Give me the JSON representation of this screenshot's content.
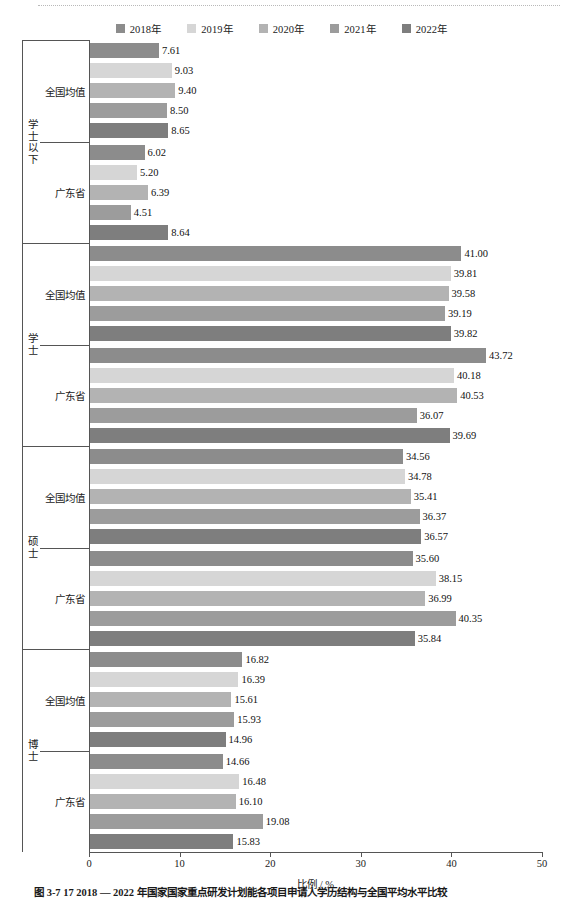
{
  "chart_data": {
    "type": "bar",
    "orientation": "horizontal",
    "title": "",
    "xlabel": "比例 / %",
    "ylabel": "",
    "xlim": [
      0,
      50
    ],
    "xticks": [
      0,
      10,
      20,
      30,
      40,
      50
    ],
    "grid": false,
    "legend_position": "top-center",
    "legend": [
      "2018年",
      "2019年",
      "2020年",
      "2021年",
      "2022年"
    ],
    "series_colors": [
      "#8c8c8c",
      "#d6d6d6",
      "#b3b3b3",
      "#9c9c9c",
      "#7e7e7e"
    ],
    "groups": [
      {
        "label": "学士以下",
        "subgroups": [
          {
            "label": "全国均值",
            "values": [
              7.61,
              9.03,
              9.4,
              8.5,
              8.65
            ],
            "value_labels": [
              "7.61",
              "9.03",
              "9.40",
              "8.50",
              "8.65"
            ]
          },
          {
            "label": "广东省",
            "values": [
              6.02,
              5.2,
              6.39,
              4.51,
              8.64
            ],
            "value_labels": [
              "6.02",
              "5.20",
              "6.39",
              "4.51",
              "8.64"
            ]
          }
        ]
      },
      {
        "label": "学士",
        "subgroups": [
          {
            "label": "全国均值",
            "values": [
              41.0,
              39.81,
              39.58,
              39.19,
              39.82
            ],
            "value_labels": [
              "41.00",
              "39.81",
              "39.58",
              "39.19",
              "39.82"
            ]
          },
          {
            "label": "广东省",
            "values": [
              43.72,
              40.18,
              40.53,
              36.07,
              39.69
            ],
            "value_labels": [
              "43.72",
              "40.18",
              "40.53",
              "36.07",
              "39.69"
            ]
          }
        ]
      },
      {
        "label": "硕士",
        "subgroups": [
          {
            "label": "全国均值",
            "values": [
              34.56,
              34.78,
              35.41,
              36.37,
              36.57
            ],
            "value_labels": [
              "34.56",
              "34.78",
              "35.41",
              "36.37",
              "36.57"
            ]
          },
          {
            "label": "广东省",
            "values": [
              35.6,
              38.15,
              36.99,
              40.35,
              35.84
            ],
            "value_labels": [
              "35.60",
              "38.15",
              "36.99",
              "40.35",
              "35.84"
            ]
          }
        ]
      },
      {
        "label": "博士",
        "subgroups": [
          {
            "label": "全国均值",
            "values": [
              16.82,
              16.39,
              15.61,
              15.93,
              14.96
            ],
            "value_labels": [
              "16.82",
              "16.39",
              "15.61",
              "15.93",
              "14.96"
            ]
          },
          {
            "label": "广东省",
            "values": [
              14.66,
              16.48,
              16.1,
              19.08,
              15.83
            ],
            "value_labels": [
              "14.66",
              "16.48",
              "16.10",
              "19.08",
              "15.83"
            ]
          }
        ]
      }
    ]
  },
  "caption": "图 3-7  17  2018 — 2022 年国家国家重点研发计划能各项目申请人学历结构与全国平均水平比较"
}
